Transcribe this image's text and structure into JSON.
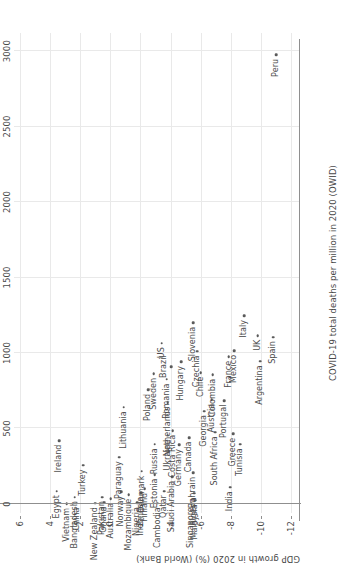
{
  "chart_data": {
    "type": "scatter",
    "title": "",
    "xlabel": "COVID-19 total deaths per million in 2020 (OWID)",
    "ylabel": "GDP growth in 2020 (%) (World Bank)",
    "xlim": [
      -60,
      3120
    ],
    "ylim": [
      -12.6,
      6.4
    ],
    "xticks": [
      0,
      500,
      1000,
      1500,
      2000,
      2500,
      3000
    ],
    "xticklabels": [
      "0",
      "500",
      "1000",
      "1500",
      "2000",
      "2500",
      "3000"
    ],
    "yticks": [
      6,
      4,
      2,
      0,
      -2,
      -4,
      -6,
      -8,
      -10,
      -12
    ],
    "yticklabels": [
      "6",
      "4",
      "2",
      "0",
      "-2",
      "-4",
      "-6",
      "-8",
      "-10",
      "-12"
    ],
    "grid": true,
    "legend": false,
    "marker_color": "#5a5a5a",
    "grid_color": "#e9e9e9",
    "axis_color": "#8f8f8f",
    "points": [
      {
        "label": "Egypt",
        "x": 85,
        "y": 3.57,
        "pos": "l"
      },
      {
        "label": "Ireland",
        "x": 420,
        "y": 3.4,
        "pos": "l"
      },
      {
        "label": "Vietnam",
        "x": 0,
        "y": 2.91,
        "pos": "l"
      },
      {
        "label": "Bangladesh",
        "x": 45,
        "y": 2.38,
        "pos": "l"
      },
      {
        "label": "Turkey",
        "x": 255,
        "y": 1.79,
        "pos": "l"
      },
      {
        "label": "China",
        "x": 3,
        "y": 2.24,
        "pos": "l"
      },
      {
        "label": "New Zealand",
        "x": 5,
        "y": 1.02,
        "pos": "l"
      },
      {
        "label": "Pakistan",
        "x": 45,
        "y": 0.53,
        "pos": "l"
      },
      {
        "label": "Ghana",
        "x": 10,
        "y": 0.41,
        "pos": "l"
      },
      {
        "label": "Australia",
        "x": 35,
        "y": -0.02,
        "pos": "l"
      },
      {
        "label": "Norway",
        "x": 80,
        "y": -0.72,
        "pos": "l"
      },
      {
        "label": "Paraguay",
        "x": 310,
        "y": -0.6,
        "pos": "l"
      },
      {
        "label": "Mozambique",
        "x": 60,
        "y": -1.22,
        "pos": "l"
      },
      {
        "label": "Nigeria",
        "x": 6,
        "y": -1.79,
        "pos": "l"
      },
      {
        "label": "Indonesia",
        "x": 75,
        "y": -2.07,
        "pos": "l"
      },
      {
        "label": "Denmark",
        "x": 215,
        "y": -2.08,
        "pos": "l"
      },
      {
        "label": "Finland",
        "x": 100,
        "y": -2.27,
        "pos": "l"
      },
      {
        "label": "Estonia",
        "x": 195,
        "y": -2.94,
        "pos": "l"
      },
      {
        "label": "Lithuania",
        "x": 640,
        "y": -0.88,
        "pos": "l"
      },
      {
        "label": "Russia",
        "x": 395,
        "y": -2.95,
        "pos": "l"
      },
      {
        "label": "Poland",
        "x": 755,
        "y": -2.52,
        "pos": "l"
      },
      {
        "label": "Sweden",
        "x": 862,
        "y": -2.88,
        "pos": "l"
      },
      {
        "label": "Cambodia",
        "x": 5,
        "y": -3.14,
        "pos": "l"
      },
      {
        "label": "Qatar",
        "x": 85,
        "y": -3.56,
        "pos": "l"
      },
      {
        "label": "Netherlands",
        "x": 670,
        "y": -3.8,
        "pos": "l"
      },
      {
        "label": "Romania",
        "x": 825,
        "y": -3.74,
        "pos": "l"
      },
      {
        "label": "US",
        "x": 1065,
        "y": -3.4,
        "pos": "l"
      },
      {
        "label": "Ukraine",
        "x": 455,
        "y": -3.8,
        "pos": "l"
      },
      {
        "label": "Saudi Arabia",
        "x": 180,
        "y": -4.11,
        "pos": "l"
      },
      {
        "label": "Costa Rica",
        "x": 485,
        "y": -4.14,
        "pos": "l"
      },
      {
        "label": "Brazil",
        "x": 910,
        "y": -4.06,
        "pos": "t"
      },
      {
        "label": "Hungary",
        "x": 940,
        "y": -4.7,
        "pos": "l"
      },
      {
        "label": "Singapore",
        "x": 5,
        "y": -5.39,
        "pos": "l"
      },
      {
        "label": "Germany",
        "x": 390,
        "y": -4.57,
        "pos": "l"
      },
      {
        "label": "Canada",
        "x": 440,
        "y": -5.22,
        "pos": "l"
      },
      {
        "label": "Algeria",
        "x": 70,
        "y": -5.56,
        "pos": "l"
      },
      {
        "label": "Bahrain",
        "x": 205,
        "y": -5.5,
        "pos": "l"
      },
      {
        "label": "Malaysia",
        "x": 25,
        "y": -5.65,
        "pos": "l"
      },
      {
        "label": "Georgia",
        "x": 615,
        "y": -6.23,
        "pos": "l"
      },
      {
        "label": "Chile",
        "x": 870,
        "y": -6.0,
        "pos": "l"
      },
      {
        "label": "Czechia",
        "x": 1010,
        "y": -5.78,
        "pos": "l"
      },
      {
        "label": "Slovenia",
        "x": 1200,
        "y": -5.51,
        "pos": "l"
      },
      {
        "label": "South Africa",
        "x": 475,
        "y": -6.96,
        "pos": "l"
      },
      {
        "label": "Austria",
        "x": 690,
        "y": -6.73,
        "pos": "l"
      },
      {
        "label": "Colombia",
        "x": 855,
        "y": -6.81,
        "pos": "l"
      },
      {
        "label": "Portugal",
        "x": 685,
        "y": -7.56,
        "pos": "l"
      },
      {
        "label": "India",
        "x": 110,
        "y": -7.96,
        "pos": "l"
      },
      {
        "label": "Greece",
        "x": 465,
        "y": -8.18,
        "pos": "l"
      },
      {
        "label": "Tunisia",
        "x": 395,
        "y": -8.61,
        "pos": "l"
      },
      {
        "label": "France",
        "x": 975,
        "y": -7.86,
        "pos": "l"
      },
      {
        "label": "Mexico",
        "x": 1015,
        "y": -8.24,
        "pos": "l"
      },
      {
        "label": "Italy",
        "x": 1245,
        "y": -8.9,
        "pos": "l"
      },
      {
        "label": "UK",
        "x": 1115,
        "y": -9.79,
        "pos": "l"
      },
      {
        "label": "Argentina",
        "x": 945,
        "y": -9.94,
        "pos": "l"
      },
      {
        "label": "Spain",
        "x": 1105,
        "y": -10.82,
        "pos": "l"
      },
      {
        "label": "Peru",
        "x": 2975,
        "y": -11.03,
        "pos": "l"
      }
    ]
  }
}
